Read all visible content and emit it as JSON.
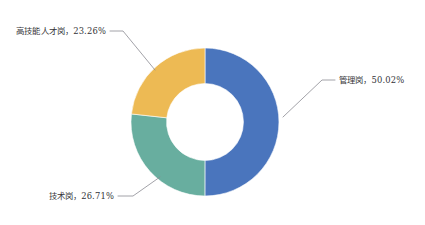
{
  "chart_data": {
    "type": "pie",
    "variant": "donut",
    "title": "",
    "subtitle": "",
    "xlabel": "",
    "ylabel": "",
    "legend": "none",
    "grid": false,
    "background_color": "#ffffff",
    "label_color": "#353539",
    "leader_line_color": "#8a8a92",
    "start_angle_deg": 0,
    "direction": "clockwise",
    "inner_radius_ratio": 0.52,
    "categories": [
      "管理岗",
      "技术岗",
      "高技能人才岗"
    ],
    "values": [
      50.02,
      26.71,
      23.26
    ],
    "value_unit": "%",
    "colors": [
      "#4a75bd",
      "#68ae9f",
      "#edba54"
    ],
    "slices": [
      {
        "name": "管理岗",
        "value": 50.02,
        "display_value": "50.02%",
        "label": "管理岗，50.02%",
        "color": "#4a75bd",
        "label_position": "right"
      },
      {
        "name": "技术岗",
        "value": 26.71,
        "display_value": "26.71%",
        "label": "技术岗，26.71%",
        "color": "#68ae9f",
        "label_position": "bottom-left"
      },
      {
        "name": "高技能人才岗",
        "value": 23.26,
        "display_value": "23.26%",
        "label": "高技能人才岗，23.26%",
        "color": "#edba54",
        "label_position": "top-left"
      }
    ]
  }
}
